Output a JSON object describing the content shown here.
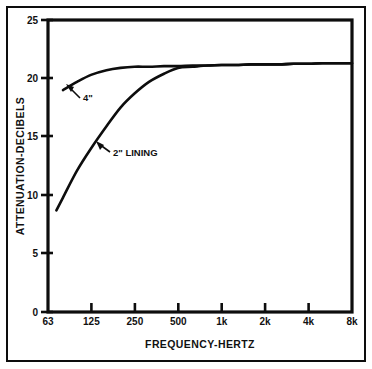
{
  "chart_data": {
    "type": "line",
    "title": "",
    "xlabel": "FREQUENCY-HERTZ",
    "ylabel": "ATTENUATION-DECIBELS",
    "x_scale": "log-octave-bands",
    "categories": [
      "63",
      "125",
      "250",
      "500",
      "1k",
      "2k",
      "4k",
      "8k"
    ],
    "x_tick_labels": [
      "63",
      "125",
      "250",
      "500",
      "1k",
      "2k",
      "4k",
      "8k"
    ],
    "y_tick_labels": [
      "0",
      "5",
      "10",
      "15",
      "20",
      "25"
    ],
    "y_ticks": [
      0,
      5,
      10,
      15,
      20,
      25
    ],
    "ylim": [
      0,
      25
    ],
    "xlim": [
      63,
      8000
    ],
    "grid": false,
    "legend": "inline-annotations",
    "series": [
      {
        "name": "4\"",
        "label": "4\"",
        "x": [
          80,
          100,
          125,
          160,
          200,
          250,
          315,
          400,
          500,
          630,
          800,
          1000,
          1250,
          1600,
          2000,
          2500,
          3150,
          4000,
          5000,
          6300,
          8000
        ],
        "values": [
          19.0,
          19.7,
          20.3,
          20.7,
          20.9,
          21.0,
          21.0,
          21.05,
          21.05,
          21.1,
          21.1,
          21.15,
          21.15,
          21.2,
          21.2,
          21.2,
          21.25,
          21.25,
          21.3,
          21.3,
          21.3
        ]
      },
      {
        "name": "2\" LINING",
        "label": "2\" LINING",
        "x": [
          72,
          80,
          100,
          125,
          160,
          200,
          250,
          315,
          400,
          500,
          630,
          800,
          1000,
          1250,
          1600,
          2000,
          2500,
          3150,
          4000,
          5000,
          6300,
          8000
        ],
        "values": [
          8.7,
          9.8,
          12.1,
          14.0,
          15.9,
          17.5,
          18.7,
          19.7,
          20.4,
          20.9,
          21.0,
          21.1,
          21.15,
          21.15,
          21.2,
          21.2,
          21.2,
          21.25,
          21.25,
          21.3,
          21.3,
          21.3
        ]
      }
    ],
    "annotations": [
      {
        "text": "4\"",
        "points_to_series": "4\"",
        "at_x": 100,
        "at_y": 20.0
      },
      {
        "text": "2\" LINING",
        "points_to_series": "2\" LINING",
        "at_x": 160,
        "at_y": 15.2
      }
    ]
  },
  "axes": {
    "y_title": "ATTENUATION-DECIBELS",
    "x_title": "FREQUENCY-HERTZ",
    "y_labels": [
      "25",
      "20",
      "15",
      "10",
      "5",
      "0"
    ],
    "x_labels": [
      "63",
      "125",
      "250",
      "500",
      "1k",
      "2k",
      "4k",
      "8k"
    ]
  },
  "labels": {
    "curve_4in": "4\"",
    "curve_2in": "2\" LINING"
  },
  "colors": {
    "ink": "#0d0d0d",
    "background": "#ffffff"
  }
}
